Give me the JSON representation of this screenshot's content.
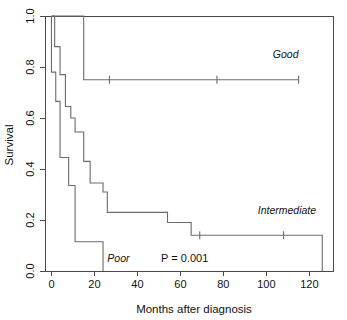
{
  "chart_data": {
    "type": "line",
    "subtype": "kaplan-meier-step",
    "title": "",
    "xlabel": "Months after diagnosis",
    "ylabel": "Survival",
    "xlim": [
      -3,
      131
    ],
    "ylim": [
      0.0,
      1.0
    ],
    "xticks": [
      0,
      20,
      40,
      60,
      80,
      100,
      120
    ],
    "xtick_labels": [
      "0",
      "20",
      "40",
      "60",
      "80",
      "100",
      "120"
    ],
    "yticks": [
      0.0,
      0.2,
      0.4,
      0.6,
      0.8,
      1.0
    ],
    "ytick_labels": [
      "0.0",
      "0.2",
      "0.4",
      "0.6",
      "0.8",
      "1.0"
    ],
    "grid": false,
    "legend_position": "inline-labels",
    "annotations": [
      {
        "name": "p-value",
        "text": "P = 0.001",
        "x": 62,
        "y": 0.035
      }
    ],
    "series": [
      {
        "name": "Good",
        "label": "Good",
        "label_x": 103,
        "label_y": 0.835,
        "color": "#6b6b6b",
        "points": [
          {
            "x": 0,
            "y": 1.0
          },
          {
            "x": 15,
            "y": 1.0
          },
          {
            "x": 15,
            "y": 0.75
          },
          {
            "x": 115,
            "y": 0.75
          }
        ],
        "censor_marks": [
          {
            "x": 27,
            "y": 0.75
          },
          {
            "x": 77,
            "y": 0.75
          },
          {
            "x": 115,
            "y": 0.75
          }
        ]
      },
      {
        "name": "Intermediate",
        "label": "Intermediate",
        "label_x": 96,
        "label_y": 0.225,
        "color": "#6b6b6b",
        "points": [
          {
            "x": 0,
            "y": 1.0
          },
          {
            "x": 1.5,
            "y": 1.0
          },
          {
            "x": 1.5,
            "y": 0.88
          },
          {
            "x": 4,
            "y": 0.88
          },
          {
            "x": 4,
            "y": 0.77
          },
          {
            "x": 6.5,
            "y": 0.77
          },
          {
            "x": 6.5,
            "y": 0.645
          },
          {
            "x": 9,
            "y": 0.645
          },
          {
            "x": 9,
            "y": 0.6
          },
          {
            "x": 11,
            "y": 0.6
          },
          {
            "x": 11,
            "y": 0.545
          },
          {
            "x": 15,
            "y": 0.545
          },
          {
            "x": 15,
            "y": 0.43
          },
          {
            "x": 18,
            "y": 0.43
          },
          {
            "x": 18,
            "y": 0.345
          },
          {
            "x": 24,
            "y": 0.345
          },
          {
            "x": 24,
            "y": 0.31
          },
          {
            "x": 26,
            "y": 0.31
          },
          {
            "x": 26,
            "y": 0.23
          },
          {
            "x": 54,
            "y": 0.23
          },
          {
            "x": 54,
            "y": 0.19
          },
          {
            "x": 65,
            "y": 0.19
          },
          {
            "x": 65,
            "y": 0.14
          },
          {
            "x": 126,
            "y": 0.14
          },
          {
            "x": 126,
            "y": 0.0
          }
        ],
        "censor_marks": [
          {
            "x": 69,
            "y": 0.14
          },
          {
            "x": 108,
            "y": 0.14
          }
        ]
      },
      {
        "name": "Poor",
        "label": "Poor",
        "label_x": 26,
        "label_y": 0.035,
        "color": "#6b6b6b",
        "points": [
          {
            "x": 0,
            "y": 1.0
          },
          {
            "x": 0,
            "y": 0.78
          },
          {
            "x": 2,
            "y": 0.78
          },
          {
            "x": 2,
            "y": 0.665
          },
          {
            "x": 4,
            "y": 0.665
          },
          {
            "x": 4,
            "y": 0.445
          },
          {
            "x": 8,
            "y": 0.445
          },
          {
            "x": 8,
            "y": 0.335
          },
          {
            "x": 11,
            "y": 0.335
          },
          {
            "x": 11,
            "y": 0.115
          },
          {
            "x": 24,
            "y": 0.115
          },
          {
            "x": 24,
            "y": 0.0
          }
        ],
        "censor_marks": []
      }
    ]
  },
  "figure": {
    "name": "kaplan-meier-survival-plot",
    "background": "#ffffff",
    "axis_color": "#4a4a4a",
    "curve_color": "#6b6b6b",
    "text_color": "#111111"
  }
}
